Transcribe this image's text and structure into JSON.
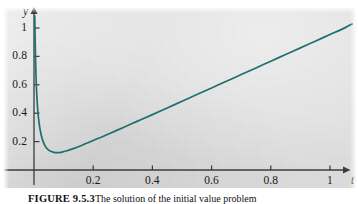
{
  "figure": {
    "caption_label": "FIGURE 9.5.3",
    "caption_text": "The solution of the initial value problem",
    "curve_color": "#1d6f70",
    "axis_color": "#3a3c40",
    "panel_color": "#e0e0e0"
  },
  "chart_data": {
    "type": "line",
    "title": "",
    "xlabel": "t",
    "ylabel": "y",
    "xlim": [
      -0.02,
      1.085
    ],
    "ylim": [
      -0.045,
      1.1
    ],
    "grid": false,
    "legend": null,
    "xticks": [
      0.2,
      0.4,
      0.6,
      0.8,
      1
    ],
    "xtick_labels": [
      "0.2",
      "0.4",
      "0.6",
      "0.8",
      "1"
    ],
    "yticks": [
      0.2,
      0.4,
      0.6,
      0.8,
      1
    ],
    "ytick_labels": [
      "0.2",
      "0.4",
      "0.6",
      "0.8",
      "1"
    ],
    "series": [
      {
        "name": "y(t)",
        "color": "#1d6f70",
        "x": [
          0.0025,
          0.0035,
          0.005,
          0.007,
          0.009,
          0.012,
          0.015,
          0.019,
          0.024,
          0.03,
          0.037,
          0.045,
          0.055,
          0.067,
          0.08,
          0.095,
          0.112,
          0.13,
          0.15,
          0.175,
          0.2,
          0.25,
          0.3,
          0.35,
          0.4,
          0.45,
          0.5,
          0.55,
          0.6,
          0.65,
          0.7,
          0.75,
          0.8,
          0.85,
          0.9,
          0.95,
          1.0,
          1.05,
          1.075
        ],
        "y": [
          1.085,
          0.96,
          0.8,
          0.65,
          0.545,
          0.44,
          0.37,
          0.305,
          0.25,
          0.205,
          0.172,
          0.148,
          0.133,
          0.124,
          0.122,
          0.126,
          0.136,
          0.149,
          0.164,
          0.186,
          0.208,
          0.252,
          0.298,
          0.344,
          0.39,
          0.437,
          0.484,
          0.531,
          0.578,
          0.625,
          0.672,
          0.719,
          0.766,
          0.813,
          0.86,
          0.907,
          0.954,
          1.001,
          1.029
        ],
        "minimum": {
          "t": 0.083,
          "y": 0.1215
        }
      }
    ],
    "axes_style": {
      "arrow_x": true,
      "arrow_y": true,
      "ticks_outward": false
    }
  }
}
